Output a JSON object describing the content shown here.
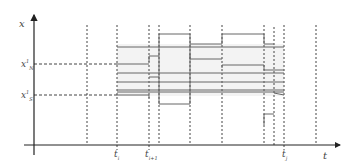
{
  "diagram": {
    "title": "",
    "axes": {
      "x_label": "t",
      "y_label": "x"
    },
    "y_ticks": [
      {
        "base": "x",
        "sup": "1",
        "sub": "N",
        "y": 64
      },
      {
        "base": "x",
        "sup": "1",
        "sub": "S",
        "y": 95
      }
    ],
    "t_ticks": [
      {
        "base": "t",
        "sub": "i",
        "x": 117
      },
      {
        "base": "t",
        "sub": "i+1",
        "x": 149
      },
      {
        "base": "t",
        "sub": "j",
        "x": 284
      }
    ],
    "colors": {
      "axis": "#222222",
      "dashed": "#444444",
      "signal": "#666666",
      "shade": "#eeeeee"
    }
  }
}
